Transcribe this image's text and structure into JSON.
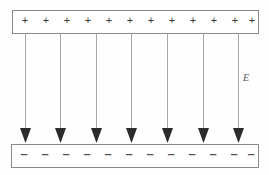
{
  "figure": {
    "width": 269,
    "height": 175,
    "background_color": "#fefefe"
  },
  "chart_data": {
    "type": "diagram",
    "title": "",
    "subtitle": "",
    "xlabel": "",
    "ylabel": "",
    "grid": false,
    "legend_position": "none",
    "colors": {
      "plate_stroke": "#8a8a8a",
      "plate_fill": "#ffffff",
      "field_line": "#a6a6a6",
      "arrow_head": "#2b2b2b",
      "charge_text": "#3a3a3a",
      "label_text": "#555555"
    },
    "elements": [
      {
        "name": "top-plate",
        "kind": "rectangle",
        "charge_sign": "+",
        "charge_count": 12,
        "x": 12,
        "y": 10,
        "width": 246,
        "height": 23
      },
      {
        "name": "bottom-plate",
        "kind": "rectangle",
        "charge_sign": "–",
        "charge_count": 12,
        "x": 11,
        "y": 144,
        "width": 247,
        "height": 23
      }
    ],
    "field_lines": {
      "count": 7,
      "direction": "downward",
      "y_start": 33,
      "y_end": 143,
      "x_positions": [
        25,
        60,
        96,
        131,
        167,
        203,
        238
      ],
      "arrow_head_width": 11,
      "arrow_head_height": 15
    },
    "top_charges": {
      "symbol": "+",
      "y": 21,
      "x_positions": [
        25,
        46,
        67,
        88,
        109,
        130,
        151,
        172,
        193,
        214,
        235,
        252
      ]
    },
    "bottom_charges": {
      "symbol": "–",
      "y": 155,
      "x_positions": [
        24,
        45,
        66,
        87,
        108,
        129,
        150,
        171,
        192,
        213,
        234,
        251
      ]
    },
    "annotations": [
      {
        "name": "field-label-E",
        "text": "E",
        "x": 246,
        "y": 79,
        "style": "italic"
      }
    ]
  }
}
